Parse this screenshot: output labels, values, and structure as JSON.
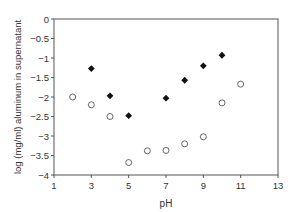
{
  "chart_data": {
    "type": "scatter",
    "title": "",
    "xlabel": "pH",
    "ylabel": "log (mg/ml) aluminum in supernatant",
    "xlim": [
      1,
      13
    ],
    "ylim": [
      -4,
      0
    ],
    "xticks": [
      1,
      3,
      5,
      7,
      9,
      11,
      13
    ],
    "yticks": [
      0,
      -0.5,
      -1,
      -1.5,
      -2,
      -2.5,
      -3,
      -3.5,
      -4
    ],
    "ytick_labels": [
      "0",
      "-0.5",
      "-1",
      "-1.5",
      "-2",
      "-2.5",
      "-3",
      "-3.5",
      "-4"
    ],
    "grid": false,
    "legend": null,
    "series": [
      {
        "name": "filled diamonds",
        "marker": "diamond-filled",
        "color": "#111111",
        "x": [
          3,
          4,
          5,
          7,
          8,
          9,
          10
        ],
        "y": [
          -1.27,
          -1.97,
          -2.48,
          -2.03,
          -1.57,
          -1.2,
          -0.93
        ]
      },
      {
        "name": "open circles",
        "marker": "circle-open",
        "color": "#555555",
        "x": [
          2,
          3,
          4,
          5,
          6,
          7,
          8,
          9,
          10,
          11
        ],
        "y": [
          -2.0,
          -2.2,
          -2.5,
          -3.68,
          -3.38,
          -3.37,
          -3.2,
          -3.02,
          -2.15,
          -1.67
        ]
      }
    ]
  }
}
